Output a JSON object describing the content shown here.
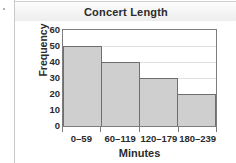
{
  "panel": {
    "title": "Concert Length"
  },
  "chart_data": {
    "type": "bar",
    "title": "Concert Length",
    "xlabel": "Minutes",
    "ylabel": "Frequency",
    "categories": [
      "0–59",
      "60–119",
      "120–179",
      "180–239"
    ],
    "values": [
      50,
      40,
      30,
      20
    ],
    "ylim": [
      0,
      60
    ],
    "ytick_labels": [
      "60",
      "50",
      "40",
      "30",
      "20",
      "10",
      "0"
    ],
    "ytick_values": [
      60,
      50,
      40,
      30,
      20,
      10,
      0
    ],
    "ytick_step": 10,
    "grid": true,
    "legend": false,
    "bar_fill_color": "#cfcfcf",
    "bar_border_color": "#6e6e6e",
    "axis_color": "#7d7d7d",
    "grid_color": "#e2e2e2",
    "text_color": "#2b2b2b"
  }
}
